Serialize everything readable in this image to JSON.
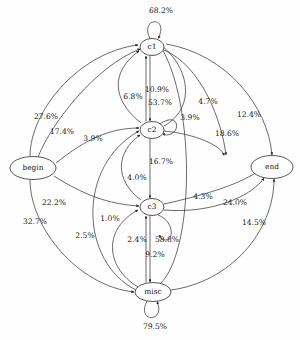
{
  "diagram": {
    "type": "directed-graph",
    "background_color": "#fefefe",
    "stroke_color": "#2b2b2b",
    "nodes": [
      {
        "id": "begin",
        "label": "begin",
        "cx": 33,
        "cy": 168,
        "rx": 23,
        "ry": 11.5
      },
      {
        "id": "c1",
        "label": "c1",
        "cx": 152,
        "cy": 47,
        "rx": 12,
        "ry": 8.5
      },
      {
        "id": "c2",
        "label": "c2",
        "cx": 152,
        "cy": 130,
        "rx": 12,
        "ry": 8.5
      },
      {
        "id": "c3",
        "label": "c3",
        "cx": 152,
        "cy": 207,
        "rx": 12,
        "ry": 8.5
      },
      {
        "id": "misc",
        "label": "misc",
        "cx": 153,
        "cy": 292,
        "rx": 18,
        "ry": 9.5
      },
      {
        "id": "end",
        "label": "end",
        "cx": 272,
        "cy": 167,
        "rx": 21,
        "ry": 11.5
      }
    ],
    "edges": [
      {
        "from": "c1",
        "to": "c1",
        "label": "68.2%",
        "label_x": 161,
        "label_y": 11
      },
      {
        "from": "c2",
        "to": "c2",
        "label": "53.7%",
        "label_x": 160,
        "label_y": 103
      },
      {
        "from": "c3",
        "to": "c3",
        "label": "58.8%",
        "label_x": 167,
        "label_y": 240
      },
      {
        "from": "misc",
        "to": "misc",
        "label": "79.5%",
        "label_x": 155,
        "label_y": 327
      },
      {
        "from": "begin",
        "to": "c1",
        "label": "27.6%",
        "label_x": 46,
        "label_y": 117
      },
      {
        "from": "begin",
        "to": "c1",
        "label": "17.4%",
        "label_x": 62,
        "label_y": 132
      },
      {
        "from": "begin",
        "to": "c2",
        "label": "3.9%",
        "label_x": 93,
        "label_y": 139
      },
      {
        "from": "begin",
        "to": "c3",
        "label": "22.2%",
        "label_x": 54,
        "label_y": 203
      },
      {
        "from": "begin",
        "to": "misc",
        "label": "32.7%",
        "label_x": 35,
        "label_y": 222
      },
      {
        "from": "c2",
        "to": "c1",
        "label": "6.8%",
        "label_x": 133,
        "label_y": 97
      },
      {
        "from": "c1",
        "to": "c2",
        "label": "10.9%",
        "label_x": 157,
        "label_y": 90
      },
      {
        "from": "c1",
        "to": "end",
        "label": "4.7%",
        "label_x": 208,
        "label_y": 102
      },
      {
        "from": "c1",
        "to": "end",
        "label": "12.4%",
        "label_x": 249,
        "label_y": 115
      },
      {
        "from": "c2",
        "to": "c1",
        "label": "3.9%",
        "label_x": 190,
        "label_y": 118
      },
      {
        "from": "c2",
        "to": "end",
        "label": "18.6%",
        "label_x": 227,
        "label_y": 134
      },
      {
        "from": "c2",
        "to": "c3",
        "label": "16.7%",
        "label_x": 161,
        "label_y": 162
      },
      {
        "from": "c3",
        "to": "c2",
        "label": "4.0%",
        "label_x": 137,
        "label_y": 178
      },
      {
        "from": "c3",
        "to": "end",
        "label": "4.3%",
        "label_x": 203,
        "label_y": 197
      },
      {
        "from": "c3",
        "to": "end",
        "label": "24.0%",
        "label_x": 235,
        "label_y": 203
      },
      {
        "from": "misc",
        "to": "c3",
        "label": "1.0%",
        "label_x": 110,
        "label_y": 219
      },
      {
        "from": "misc",
        "to": "c2",
        "label": "2.5%",
        "label_x": 85,
        "label_y": 236
      },
      {
        "from": "c3",
        "to": "misc",
        "label": "2.4%",
        "label_x": 137,
        "label_y": 240
      },
      {
        "from": "misc",
        "to": "c1",
        "label": "9.2%",
        "label_x": 155,
        "label_y": 255
      },
      {
        "from": "misc",
        "to": "end",
        "label": "14.5%",
        "label_x": 254,
        "label_y": 223
      }
    ]
  }
}
